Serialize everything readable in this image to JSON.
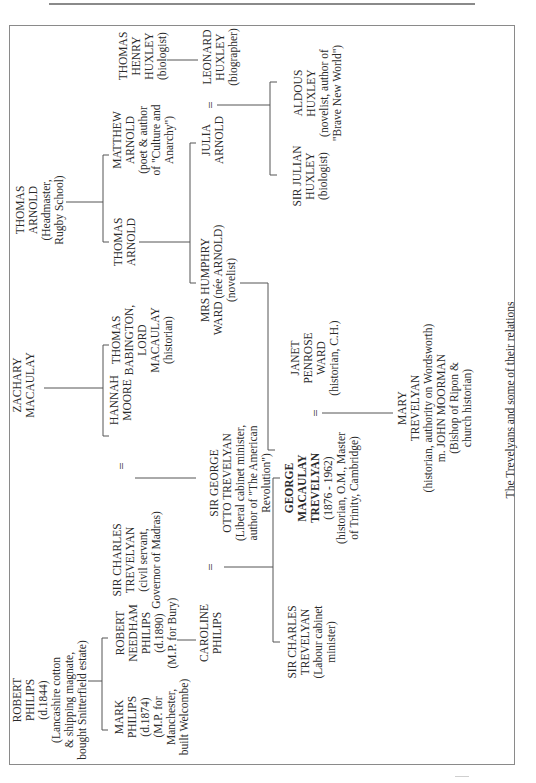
{
  "figure": {
    "caption": "The Trevelyans and some of their relations",
    "orientation": "rotated 90° counter-clockwise (landscape on portrait page)"
  },
  "people": {
    "robert_philips": {
      "lines": [
        "ROBERT",
        "PHILIPS",
        "(d.1844)",
        "(Lancashire cotton",
        "& shipping magnate,",
        "bought Snitterfield estate)"
      ]
    },
    "mark_philips": {
      "lines": [
        "MARK",
        "PHILIPS",
        "(d.1874)",
        "(M.P. for",
        "Manchester,",
        "built Welcombe)"
      ]
    },
    "robert_needham_philips": {
      "lines": [
        "ROBERT",
        "NEEDHAM",
        "PHILIPS",
        "(d.1890)",
        "(M.P. for Bury)"
      ]
    },
    "caroline_philips": {
      "lines": [
        "CAROLINE",
        "PHILIPS"
      ]
    },
    "sir_charles_trevelyan_civil": {
      "lines": [
        "SIR CHARLES",
        "TREVELYAN",
        "(civil servant,",
        "Governor of Madras)"
      ]
    },
    "hannah_moore": {
      "lines": [
        "HANNAH",
        "MOORE"
      ]
    },
    "zachary_macaulay": {
      "lines": [
        "ZACHARY",
        "MACAULAY"
      ]
    },
    "thomas_babington_macaulay": {
      "lines": [
        "THOMAS",
        "BABINGTON,",
        "LORD",
        "MACAULAY",
        "(historian)"
      ]
    },
    "sir_george_otto_trevelyan": {
      "lines": [
        "SIR GEORGE",
        "OTTO TREVELYAN",
        "(Liberal cabinet minister,",
        "author of \"The American",
        "Revolution\")"
      ]
    },
    "sir_charles_trevelyan_labour": {
      "lines": [
        "SIR CHARLES",
        "TREVELYAN",
        "(Labour cabinet",
        "minister)"
      ]
    },
    "george_macaulay_trevelyan": {
      "lines": [
        "GEORGE",
        "MACAULAY",
        "TREVELYAN",
        "(1876 - 1962)",
        "(historian, O.M., Master",
        "of Trinity, Cambridge)"
      ]
    },
    "janet_penrose_ward": {
      "lines": [
        "JANET",
        "PENROSE",
        "WARD",
        "(historian, C.H.)"
      ]
    },
    "mary_trevelyan": {
      "lines": [
        "MARY",
        "TREVELYAN",
        "(historian, authority on Wordsworth)",
        "m. JOHN MOORMAN",
        "(Bishop of Ripon &",
        "church historian)"
      ]
    },
    "thomas_arnold_headmaster": {
      "lines": [
        "THOMAS",
        "ARNOLD",
        "(Headmaster,",
        "Rugby School)"
      ]
    },
    "thomas_arnold_son": {
      "lines": [
        "THOMAS",
        "ARNOLD"
      ]
    },
    "matthew_arnold": {
      "lines": [
        "MATTHEW",
        "ARNOLD",
        "(poet & author",
        "of \"Culture and",
        "Anarchy\")"
      ]
    },
    "mrs_humphry_ward": {
      "lines": [
        "MRS HUMPHRY",
        "WARD (née ARNOLD)",
        "(novelist)"
      ]
    },
    "julia_arnold": {
      "lines": [
        "JULIA",
        "ARNOLD"
      ]
    },
    "thomas_henry_huxley": {
      "lines": [
        "THOMAS",
        "HENRY",
        "HUXLEY",
        "(biologist)"
      ]
    },
    "leonard_huxley": {
      "lines": [
        "LEONARD",
        "HUXLEY",
        "(biographer)"
      ]
    },
    "sir_julian_huxley": {
      "lines": [
        "SIR JULIAN",
        "HUXLEY",
        "(biologist)"
      ]
    },
    "aldous_huxley": {
      "lines": [
        "ALDOUS",
        "HUXLEY",
        "(novelist, author of",
        "\"Brave New World\")"
      ]
    }
  },
  "symbols": {
    "marriage": "="
  },
  "colors": {
    "text": "#2a2a2a",
    "lines": "#555555",
    "frame": "#8a8a8a",
    "background": "#ffffff"
  }
}
